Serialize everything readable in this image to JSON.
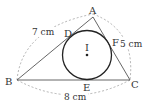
{
  "figure": {
    "points": {
      "A": {
        "label": "A",
        "x": 93,
        "y": 17
      },
      "B": {
        "label": "B",
        "x": 17,
        "y": 80
      },
      "C": {
        "label": "C",
        "x": 130,
        "y": 80
      },
      "D": {
        "label": "D"
      },
      "E": {
        "label": "E"
      },
      "F": {
        "label": "F"
      },
      "I": {
        "label": "I",
        "x": 87,
        "y": 55
      }
    },
    "incircle": {
      "cx": 87,
      "cy": 55,
      "r": 24.5
    },
    "measurements": {
      "AB": "7 cm",
      "AC": "5 cm",
      "BC": "8 cm"
    },
    "colors": {
      "solid_line": "#444444",
      "circle": "#222222",
      "dashed_arc": "#9a9a9a",
      "text": "#333333"
    }
  }
}
